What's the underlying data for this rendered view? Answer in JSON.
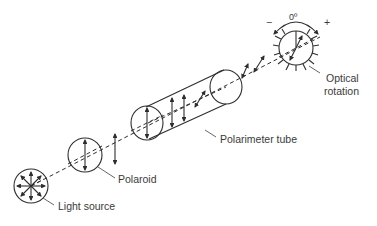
{
  "diagram": {
    "labels": {
      "light_source": "Light source",
      "polaroid": "Polaroid",
      "polarimeter_tube": "Polarimeter tube",
      "optical_rotation_line1": "Optical",
      "optical_rotation_line2": "rotation",
      "zero_degree": "0º",
      "minus_sign": "−",
      "plus_sign": "+"
    },
    "components": [
      {
        "name": "Light source",
        "shape": "circle with radial arrows (unpolarized light)"
      },
      {
        "name": "Polaroid",
        "shape": "circle with vertical double arrow (polarizer)"
      },
      {
        "name": "Polarimeter tube",
        "shape": "cylinder containing vertically polarized light"
      },
      {
        "name": "Optical rotation",
        "shape": "analyzer dial with tick marks, rotated double arrow, ± rotation arc"
      }
    ],
    "colors": {
      "line": "#2e2e2e",
      "text": "#3a3a3a",
      "background": "#ffffff"
    }
  }
}
